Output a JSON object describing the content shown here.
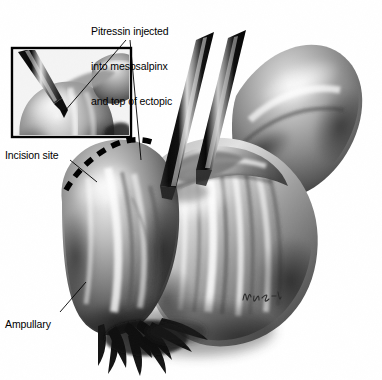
{
  "figure": {
    "kind": "medical-illustration",
    "technique": "grayscale-airbrush-pencil",
    "background_color": "#ffffff",
    "ink_color": "#000000",
    "width": 382,
    "height": 380
  },
  "annotations": {
    "pitressin": {
      "lines": [
        "Pitressin injected",
        "into mesosalpinx",
        "and top of ectopic"
      ],
      "line1": "Pitressin injected",
      "line2": "into mesosalpinx",
      "line3": "and top of ectopic"
    },
    "incision": {
      "label": "Incision site"
    },
    "ampullary": {
      "label": "Ampullary"
    }
  },
  "signature": {
    "text": "M.R.",
    "style": "handwritten-artist-initials"
  },
  "inset": {
    "name": "pitressin-injection-detail",
    "frame": {
      "x": 12,
      "y": 48,
      "width": 119,
      "height": 89,
      "border_color": "#000000",
      "border_width": 2
    },
    "contents": "needle injecting pitressin into the top of the distended tube"
  },
  "instruments": [
    {
      "name": "laparoscopic-trocar-left",
      "color": "#111111"
    },
    {
      "name": "laparoscopic-trocar-right",
      "color": "#111111"
    },
    {
      "name": "injection-needle",
      "color": "#141414"
    }
  ],
  "anatomy": [
    {
      "name": "ectopic-gestation-mass",
      "tone": "#8a8a8a"
    },
    {
      "name": "fallopian-tube-ampulla",
      "tone": "#9a9a9a"
    },
    {
      "name": "mesosalpinx",
      "tone": "#7e7e7e"
    },
    {
      "name": "uterine-fundus",
      "tone": "#8f8f8f"
    },
    {
      "name": "fimbriae",
      "tone": "#1a1a1a"
    }
  ],
  "incision_marking": {
    "name": "dashed-incision-line",
    "color": "#000000",
    "style": "dashed"
  }
}
